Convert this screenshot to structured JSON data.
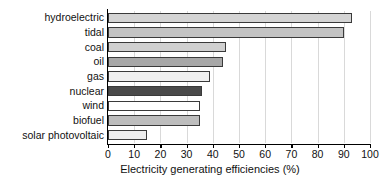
{
  "chart_data": {
    "type": "bar",
    "orientation": "horizontal",
    "title": "",
    "xlabel": "Electricity generating efficiencies (%)",
    "ylabel": "",
    "xlim": [
      0,
      100
    ],
    "xticks": [
      0,
      10,
      20,
      30,
      40,
      50,
      60,
      70,
      80,
      90,
      100
    ],
    "grid": true,
    "grid_axis": "x",
    "legend": false,
    "categories": [
      "hydroelectric",
      "tidal",
      "coal",
      "oil",
      "gas",
      "nuclear",
      "wind",
      "biofuel",
      "solar photovoltaic"
    ],
    "values": [
      93,
      90,
      45,
      44,
      39,
      36,
      35,
      35,
      15
    ],
    "bar_colors": [
      "#d4d4d4",
      "#c3c3c3",
      "#d0d0d0",
      "#a8a8a8",
      "#efefef",
      "#4a4a4a",
      "#ffffff",
      "#bdbdbd",
      "#ededed"
    ],
    "bar_edge_color": "#3a3a3a",
    "axis_color": "#000000",
    "grid_color": "#d9d9d9"
  }
}
